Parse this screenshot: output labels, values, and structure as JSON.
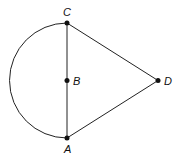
{
  "diagram": {
    "type": "geometry",
    "colors": {
      "stroke": "#222222",
      "point": "#111111",
      "background": "#ffffff"
    },
    "points": [
      {
        "id": "C",
        "label": "C",
        "x": 67,
        "y": 23,
        "label_x": 67,
        "label_y": 16
      },
      {
        "id": "B",
        "label": "B",
        "x": 67,
        "y": 80.5,
        "label_x": 73,
        "label_y": 84.5
      },
      {
        "id": "A",
        "label": "A",
        "x": 67,
        "y": 138,
        "label_x": 68,
        "label_y": 152
      },
      {
        "id": "D",
        "label": "D",
        "x": 158,
        "y": 80.5,
        "label_x": 164,
        "label_y": 84.5
      }
    ],
    "segments": [
      {
        "from": "C",
        "to": "A",
        "name": "CA"
      },
      {
        "from": "C",
        "to": "D",
        "name": "CD"
      },
      {
        "from": "A",
        "to": "D",
        "name": "AD"
      }
    ],
    "arcs": [
      {
        "name": "semicircle-CA",
        "center": "B",
        "from": "C",
        "to": "A",
        "side": "left"
      }
    ]
  }
}
